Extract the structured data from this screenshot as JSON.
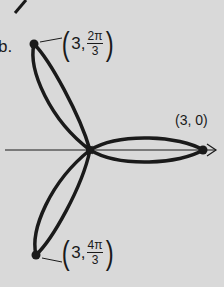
{
  "figure": {
    "part_label": "b.",
    "curve": "three-petal rose",
    "axis": "polar axis",
    "points": {
      "right": {
        "label": "(3, 0)",
        "r": "3",
        "theta": "0"
      },
      "top": {
        "r": "3",
        "theta_num": "2π",
        "theta_den": "3",
        "open": "(",
        "comma": "3,",
        "close": ")"
      },
      "bottom": {
        "r": "3",
        "theta_num": "4π",
        "theta_den": "3",
        "open": "(",
        "comma": "3,",
        "close": ")"
      }
    },
    "colors": {
      "background": "#d9d9d9",
      "ink": "#1a1a1a"
    }
  }
}
